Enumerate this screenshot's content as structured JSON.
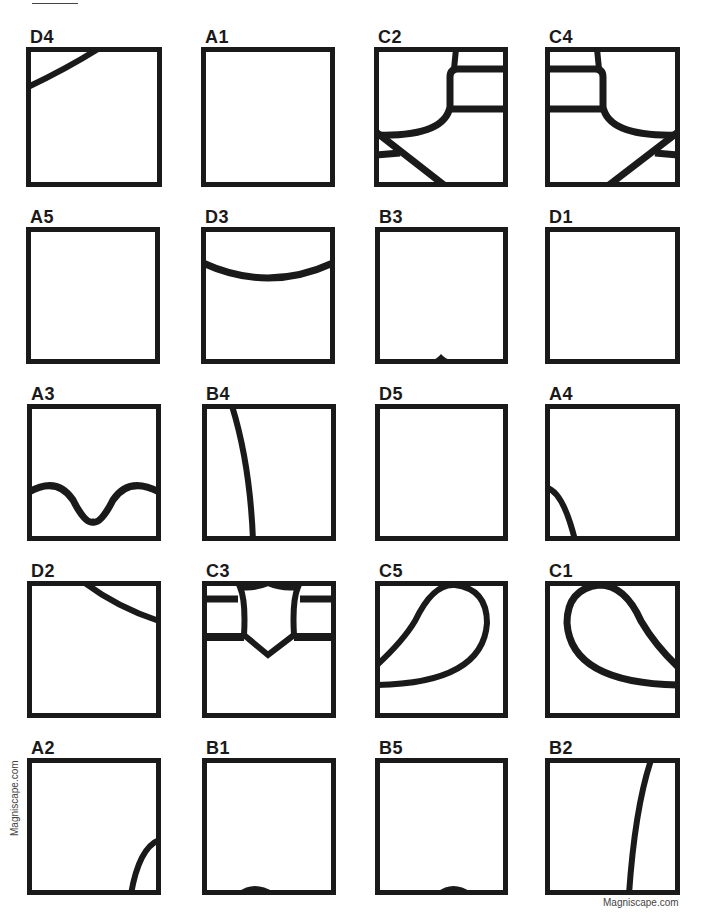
{
  "header": {
    "instruction_visible": "Instructions (clipped at top edge — text not legible)",
    "label_underlined": ""
  },
  "tiles": [
    {
      "label": "D4",
      "drawing": "arc-top-left-corner"
    },
    {
      "label": "A1",
      "drawing": "empty"
    },
    {
      "label": "C2",
      "drawing": "rounded-rect-top-right-with-diagonals-bottom-left"
    },
    {
      "label": "C4",
      "drawing": "rounded-rect-top-left-with-diagonals-bottom-right"
    },
    {
      "label": "A5",
      "drawing": "empty"
    },
    {
      "label": "D3",
      "drawing": "sagging-arc-across-top"
    },
    {
      "label": "B3",
      "drawing": "small-bump-bottom-center"
    },
    {
      "label": "D1",
      "drawing": "empty"
    },
    {
      "label": "A3",
      "drawing": "wave-lower-half"
    },
    {
      "label": "B4",
      "drawing": "curve-left-vertical"
    },
    {
      "label": "D5",
      "drawing": "empty"
    },
    {
      "label": "A4",
      "drawing": "arc-bottom-left-corner"
    },
    {
      "label": "D2",
      "drawing": "arc-top-right"
    },
    {
      "label": "C3",
      "drawing": "shield-with-bands"
    },
    {
      "label": "C5",
      "drawing": "teardrop-left"
    },
    {
      "label": "C1",
      "drawing": "teardrop-right"
    },
    {
      "label": "A2",
      "drawing": "arc-bottom-right-corner"
    },
    {
      "label": "B1",
      "drawing": "bump-bottom-center"
    },
    {
      "label": "B5",
      "drawing": "bump-bottom-center"
    },
    {
      "label": "B2",
      "drawing": "curve-right-vertical"
    }
  ],
  "watermarks": {
    "side": "Magniscape.com",
    "bottom": "Magniscape.com"
  },
  "colors": {
    "stroke": "#1a1a1a",
    "background": "#ffffff"
  }
}
